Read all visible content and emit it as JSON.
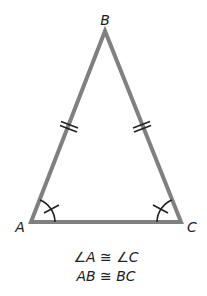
{
  "diagram": {
    "type": "isosceles-triangle",
    "vertices": {
      "A": {
        "label": "A",
        "x": 31,
        "y": 222
      },
      "B": {
        "label": "B",
        "x": 105,
        "y": 31
      },
      "C": {
        "label": "C",
        "x": 181,
        "y": 222
      }
    },
    "stroke_color": "#808080",
    "mark_color": "#222222",
    "congruent_sides": [
      "AB",
      "BC"
    ],
    "congruent_angles": [
      "A",
      "C"
    ]
  },
  "statements": [
    {
      "text": "∠A ≅ ∠C"
    },
    {
      "text": "AB ≅ BC"
    }
  ]
}
